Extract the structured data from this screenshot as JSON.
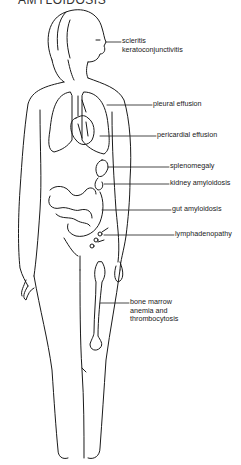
{
  "title": "AMYLOIDOSIS",
  "figure": {
    "line_color": "#1a1a1a",
    "background": "#ffffff"
  },
  "labels": [
    {
      "id": "eye",
      "lines": [
        "scleritis",
        "keratoconjunctivitis"
      ],
      "x": 122,
      "y": 39,
      "leader_from": [
        106,
        42
      ]
    },
    {
      "id": "lungs",
      "lines": [
        "pleural effusion"
      ],
      "x": 153,
      "y": 102,
      "leader_from": [
        107,
        105
      ]
    },
    {
      "id": "heart",
      "lines": [
        "pericardial effusion"
      ],
      "x": 157,
      "y": 132,
      "leader_from": [
        100,
        136
      ]
    },
    {
      "id": "spleen",
      "lines": [
        "splenomegaly"
      ],
      "x": 170,
      "y": 164,
      "leader_from": [
        118,
        167
      ]
    },
    {
      "id": "kidney",
      "lines": [
        "kidney amyloidosis"
      ],
      "x": 170,
      "y": 180,
      "leader_from": [
        113,
        184
      ]
    },
    {
      "id": "gut",
      "lines": [
        "gut amyloidosis"
      ],
      "x": 172,
      "y": 208,
      "leader_from": [
        117,
        210
      ]
    },
    {
      "id": "lymph",
      "lines": [
        "lymphadenopathy"
      ],
      "x": 175,
      "y": 233,
      "leader_from": [
        113,
        235
      ]
    },
    {
      "id": "bone",
      "lines": [
        "bone marrow",
        "anemia and",
        "thrombocytosis"
      ],
      "x": 130,
      "y": 299,
      "leader_from": [
        103,
        303
      ]
    }
  ]
}
